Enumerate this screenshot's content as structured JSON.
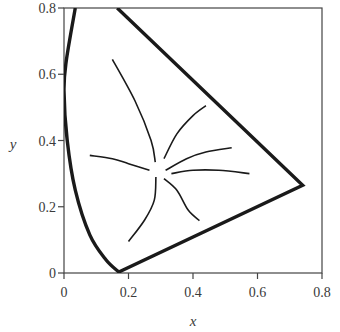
{
  "chart_data": {
    "type": "line",
    "title": "",
    "xlabel": "x",
    "ylabel": "y",
    "xlim": [
      0,
      0.8
    ],
    "ylim": [
      0,
      0.8
    ],
    "grid": false,
    "legend": null,
    "x_ticks": [
      {
        "value": 0,
        "label": "0"
      },
      {
        "value": 0.2,
        "label": "0.2"
      },
      {
        "value": 0.4,
        "label": "0.4"
      },
      {
        "value": 0.6,
        "label": "0.6"
      },
      {
        "value": 0.8,
        "label": "0.8"
      }
    ],
    "y_ticks": [
      {
        "value": 0,
        "label": "0"
      },
      {
        "value": 0.2,
        "label": "0.2"
      },
      {
        "value": 0.4,
        "label": "0.4"
      },
      {
        "value": 0.6,
        "label": "0.6"
      },
      {
        "value": 0.8,
        "label": "0.8"
      }
    ],
    "series": [
      {
        "name": "spectral locus boundary",
        "style": "thick",
        "points": [
          [
            0.035,
            0.8
          ],
          [
            0.007,
            0.64
          ],
          [
            0.0,
            0.55
          ],
          [
            0.01,
            0.4
          ],
          [
            0.035,
            0.25
          ],
          [
            0.08,
            0.115
          ],
          [
            0.13,
            0.04
          ],
          [
            0.17,
            0.003
          ],
          [
            0.74,
            0.265
          ],
          [
            0.165,
            0.8
          ]
        ]
      },
      {
        "name": "confusion line 1",
        "style": "thin",
        "points": [
          [
            0.15,
            0.645
          ],
          [
            0.22,
            0.52
          ],
          [
            0.27,
            0.4
          ],
          [
            0.283,
            0.335
          ]
        ]
      },
      {
        "name": "confusion line 2",
        "style": "thin",
        "points": [
          [
            0.08,
            0.355
          ],
          [
            0.15,
            0.345
          ],
          [
            0.2,
            0.33
          ],
          [
            0.265,
            0.31
          ]
        ]
      },
      {
        "name": "confusion line 3",
        "style": "thin",
        "points": [
          [
            0.285,
            0.29
          ],
          [
            0.28,
            0.22
          ],
          [
            0.25,
            0.16
          ],
          [
            0.2,
            0.095
          ]
        ]
      },
      {
        "name": "confusion line 4",
        "style": "thin",
        "points": [
          [
            0.31,
            0.285
          ],
          [
            0.35,
            0.25
          ],
          [
            0.385,
            0.19
          ],
          [
            0.42,
            0.158
          ]
        ]
      },
      {
        "name": "confusion line 5",
        "style": "thin",
        "points": [
          [
            0.31,
            0.345
          ],
          [
            0.35,
            0.42
          ],
          [
            0.4,
            0.475
          ],
          [
            0.44,
            0.505
          ]
        ]
      },
      {
        "name": "confusion line 6",
        "style": "thin",
        "points": [
          [
            0.315,
            0.31
          ],
          [
            0.38,
            0.345
          ],
          [
            0.44,
            0.365
          ],
          [
            0.52,
            0.378
          ]
        ]
      },
      {
        "name": "confusion line 7",
        "style": "thin",
        "points": [
          [
            0.333,
            0.3
          ],
          [
            0.4,
            0.31
          ],
          [
            0.48,
            0.31
          ],
          [
            0.575,
            0.3
          ]
        ]
      }
    ]
  },
  "plot_box": {
    "left": 64,
    "right": 322,
    "top": 8,
    "bottom": 273
  }
}
